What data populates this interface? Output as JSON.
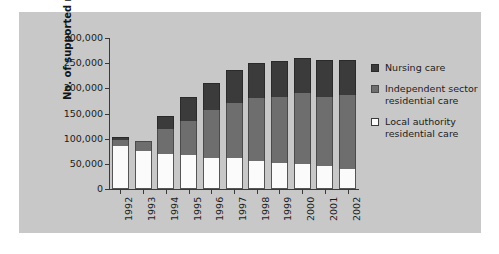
{
  "chart_data": {
    "type": "bar",
    "subtype": "stacked-bar",
    "title": "",
    "xlabel": "Year, at 31 March",
    "ylabel": "No. of supported residents",
    "categories": [
      "1992",
      "1993",
      "1994",
      "1995",
      "1996",
      "1997",
      "1998",
      "1999",
      "2000",
      "2001",
      "2002"
    ],
    "ylim": [
      0,
      300000
    ],
    "ytick_values": [
      0,
      50000,
      100000,
      150000,
      200000,
      250000,
      300000
    ],
    "ytick_labels": [
      "0",
      "50,000",
      "100,000",
      "150,000",
      "200,000",
      "250,000",
      "300,000"
    ],
    "grid": false,
    "legend_position": "right",
    "stack_order_bottom_to_top": [
      "Local authority residential care",
      "Independent sector residential care",
      "Nursing care"
    ],
    "series": [
      {
        "name": "Local authority residential care",
        "color": "#fbfbfb",
        "values": [
          85000,
          75000,
          70000,
          67000,
          62000,
          61000,
          56000,
          52000,
          50000,
          46000,
          39000
        ]
      },
      {
        "name": "Independent sector residential care",
        "color": "#6e6e6e",
        "values": [
          13000,
          20000,
          50000,
          68000,
          95000,
          110000,
          124000,
          130000,
          140000,
          137000,
          147000
        ]
      },
      {
        "name": "Nursing care",
        "color": "#3b3b3b",
        "values": [
          5000,
          0,
          26000,
          48000,
          53000,
          66000,
          70000,
          73000,
          71000,
          74000,
          71000
        ]
      }
    ],
    "totals": [
      103000,
      95000,
      146000,
      183000,
      210000,
      237000,
      250000,
      255000,
      261000,
      257000,
      257000
    ]
  },
  "legend": {
    "entries": [
      {
        "label": "Nursing care",
        "swatch": "nursing"
      },
      {
        "label": "Independent sector residential care",
        "swatch": "independent"
      },
      {
        "label": "Local authority residential care",
        "swatch": "local"
      }
    ]
  },
  "axes": {
    "y_title": "No. of supported residents",
    "x_title": "Year, at 31 March"
  },
  "colors": {
    "panel_background": "#c8c8c8",
    "figure_background": "#ffffff",
    "axis": "#3a3a3a",
    "text": "#1c1c1c",
    "nursing_care": "#3b3b3b",
    "independent_sector": "#6e6e6e",
    "local_authority": "#fbfbfb"
  }
}
